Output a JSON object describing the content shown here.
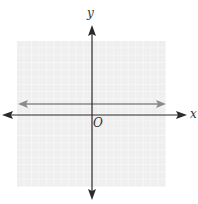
{
  "diagram": {
    "type": "coordinate-plane",
    "labels": {
      "x_axis": "x",
      "y_axis": "y",
      "origin": "O"
    },
    "grid": {
      "cells_x": 20,
      "cells_y": 20,
      "background": "#efefef",
      "line_color": "#ffffff"
    },
    "axes_color": "#2b2b2b",
    "graphed_line": {
      "kind": "horizontal",
      "y_value": 1.5,
      "color": "#8a8a8a"
    }
  }
}
